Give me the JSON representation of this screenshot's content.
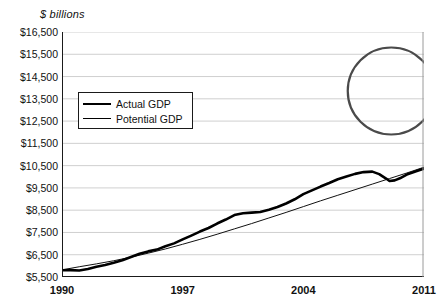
{
  "chart_data": {
    "type": "line",
    "title": "",
    "subtitle": "",
    "units_label": "$ billions",
    "xlabel": "",
    "ylabel": "",
    "xlim": [
      1990,
      2011
    ],
    "ylim": [
      5500,
      16500
    ],
    "ytick_step": 1000,
    "grid": true,
    "legend_position": "inside-upper-left",
    "yticks": [
      "$16,500",
      "$15,500",
      "$14,500",
      "$13,500",
      "$12,500",
      "$11,500",
      "$10,500",
      "$9,500",
      "$8,500",
      "$7,500",
      "$6,500",
      "$5,500"
    ],
    "ytick_values": [
      16500,
      15500,
      14500,
      13500,
      12500,
      11500,
      10500,
      9500,
      8500,
      7500,
      6500,
      5500
    ],
    "xticks": [
      "1990",
      "1997",
      "2004",
      "2011"
    ],
    "xtick_values": [
      1990,
      1997,
      2004,
      2011
    ],
    "annotations": [
      {
        "name": "output-gap-highlight",
        "shape": "circle",
        "center_x": 2009.1,
        "center_y": 13850,
        "note": "circled recession output gap"
      }
    ],
    "series": [
      {
        "name": "Actual GDP",
        "style": "thick",
        "color": "#000000",
        "x": [
          1990,
          1990.5,
          1991,
          1991.5,
          1992,
          1992.5,
          1993,
          1993.5,
          1994,
          1994.5,
          1995,
          1995.5,
          1996,
          1996.5,
          1997,
          1997.5,
          1998,
          1998.5,
          1999,
          1999.5,
          2000,
          2000.5,
          2001,
          2001.5,
          2002,
          2002.5,
          2003,
          2003.5,
          2004,
          2004.5,
          2005,
          2005.5,
          2006,
          2006.5,
          2007,
          2007.5,
          2008,
          2008.4,
          2008.8,
          2009,
          2009.3,
          2009.6,
          2010,
          2010.5,
          2011
        ],
        "values": [
          5800,
          5810,
          5790,
          5860,
          5960,
          6040,
          6140,
          6250,
          6400,
          6540,
          6650,
          6730,
          6880,
          7010,
          7190,
          7360,
          7540,
          7700,
          7900,
          8080,
          8280,
          8360,
          8390,
          8420,
          8520,
          8640,
          8800,
          8990,
          9220,
          9390,
          9560,
          9720,
          9890,
          10010,
          10130,
          10210,
          10230,
          10120,
          9920,
          9810,
          9840,
          9930,
          10100,
          10240,
          10370
        ]
      },
      {
        "name": "Potential GDP",
        "style": "thin",
        "color": "#000000",
        "x": [
          1990,
          1991,
          1992,
          1993,
          1994,
          1995,
          1996,
          1997,
          1998,
          1999,
          2000,
          2001,
          2002,
          2003,
          2004,
          2005,
          2006,
          2007,
          2008,
          2009,
          2010,
          2011
        ],
        "values": [
          5820,
          5960,
          6090,
          6230,
          6390,
          6570,
          6760,
          6970,
          7190,
          7420,
          7660,
          7900,
          8150,
          8400,
          8660,
          8920,
          9170,
          9420,
          9670,
          9920,
          10170,
          10430
        ]
      }
    ],
    "series_display_note": "plotted in $ billions on a 5,500-16,500 axis"
  },
  "legend": {
    "items": [
      {
        "label": "Actual GDP",
        "swatch": "thick-line"
      },
      {
        "label": "Potential GDP",
        "swatch": "thin-line"
      }
    ]
  }
}
